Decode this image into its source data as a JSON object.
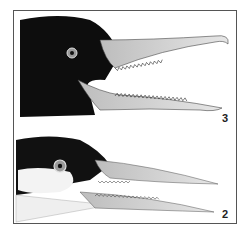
{
  "figure": {
    "panels": [
      {
        "label": "3",
        "subject": "bird head with open serrated bill (dark head)"
      },
      {
        "label": "2",
        "subject": "bird head with serrated bill (dark crown, white cheek)"
      }
    ],
    "colors": {
      "head_dark": "#0d0d0d",
      "bill_light": "#d8d8d8",
      "frame": "#555555"
    }
  }
}
